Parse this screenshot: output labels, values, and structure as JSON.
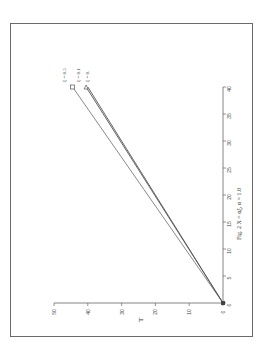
{
  "chart_data": {
    "type": "line",
    "title": "Fig. 2  X = αξ, α = 1.0",
    "xlabel": "",
    "ylabel": "T",
    "xlim": [
      0,
      40
    ],
    "ylim": [
      0,
      50
    ],
    "x_ticks": [
      "0",
      "5",
      "10",
      "15",
      "20",
      "25",
      "30",
      "35",
      "40"
    ],
    "y_ticks": [
      "0",
      "10",
      "20",
      "30",
      "40",
      "50"
    ],
    "grid": false,
    "rotation": "figure rotated 90° counter-clockwise on page",
    "x": [
      0,
      40
    ],
    "series": [
      {
        "name": "ξ = 0.5",
        "marker": "square",
        "values": [
          0,
          44.5
        ]
      },
      {
        "name": "ξ = 0.1",
        "marker": "triangle",
        "values": [
          0,
          40.5
        ]
      },
      {
        "name": "ξ = 0.",
        "marker": "none",
        "values": [
          0,
          40
        ]
      }
    ],
    "legend_position": "inline labels at line ends"
  },
  "ui": {
    "caption": "Fig. 2  X = αξ, α = 1.0",
    "t_axis_label": "T"
  }
}
